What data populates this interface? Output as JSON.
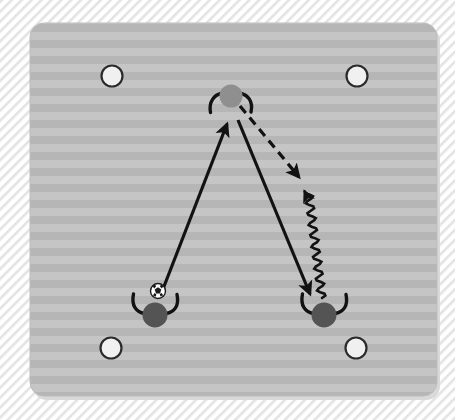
{
  "diagram": {
    "type": "soccer-training-drill",
    "canvas": {
      "width": 455,
      "height": 420
    },
    "background": {
      "name": "hatched-backdrop",
      "hatch_color": "#e2e2e2",
      "base_color": "#ffffff",
      "hatch_spacing": 7,
      "hatch_angle_deg": 45
    },
    "pitch": {
      "name": "training-field",
      "x": 30,
      "y": 23,
      "width": 407,
      "height": 373,
      "corner_radius": 14,
      "stripe_light": "#c3c3c3",
      "stripe_dark": "#b4b4b4",
      "stripe_height": 8,
      "shadow_color": "#d9d9d9"
    },
    "cones": [
      {
        "name": "cone-top-left",
        "label": "Cone",
        "cx": 112,
        "cy": 76,
        "r": 10.5,
        "fill": "#f0f0f0",
        "stroke": "#2b2b2b"
      },
      {
        "name": "cone-top-right",
        "label": "Cone",
        "cx": 357,
        "cy": 76,
        "r": 10.5,
        "fill": "#f0f0f0",
        "stroke": "#2b2b2b"
      },
      {
        "name": "cone-bottom-left",
        "label": "Cone",
        "cx": 111,
        "cy": 348,
        "r": 10.5,
        "fill": "#f0f0f0",
        "stroke": "#2b2b2b"
      },
      {
        "name": "cone-bottom-right",
        "label": "Cone",
        "cx": 356,
        "cy": 348,
        "r": 10.5,
        "fill": "#f0f0f0",
        "stroke": "#2b2b2b"
      }
    ],
    "players": [
      {
        "name": "player-target-top",
        "label": "Target player",
        "role": "target",
        "cx": 231,
        "cy": 96,
        "r": 11.5,
        "fill": "#8f8f8f",
        "arms": "both",
        "has_ball": false
      },
      {
        "name": "player-passer-bottom-left",
        "label": "Passer",
        "role": "passer",
        "cx": 155,
        "cy": 315,
        "r": 12.5,
        "fill": "#545454",
        "arms": "both",
        "has_ball": true
      },
      {
        "name": "player-receiver-bottom-right",
        "label": "Receiver",
        "role": "receiver",
        "cx": 324,
        "cy": 315,
        "r": 12.5,
        "fill": "#545454",
        "arms": "both",
        "has_ball": false
      }
    ],
    "ball": {
      "name": "soccer-ball",
      "label": "Ball",
      "cx": 158,
      "cy": 291,
      "r": 7.5,
      "fill": "#ffffff",
      "patch_color": "#1a1a1a"
    },
    "arrows": [
      {
        "name": "pass-arrow-up",
        "label": "Pass to target player",
        "style": "solid",
        "color": "#121212",
        "width": 3.2,
        "from": {
          "x": 163,
          "y": 289
        },
        "to": {
          "x": 226,
          "y": 122
        }
      },
      {
        "name": "pass-arrow-down-right",
        "label": "Pass to receiver",
        "style": "solid",
        "color": "#121212",
        "width": 3.2,
        "from": {
          "x": 238,
          "y": 120
        },
        "to": {
          "x": 311,
          "y": 296
        }
      },
      {
        "name": "run-arrow-dashed",
        "label": "Player run off the ball",
        "style": "dashed",
        "dash": "9 6",
        "color": "#121212",
        "width": 3.2,
        "from": {
          "x": 240,
          "y": 106
        },
        "to": {
          "x": 301,
          "y": 179
        }
      },
      {
        "name": "dribble-arrow-wavy",
        "label": "Dribble with ball",
        "style": "wavy",
        "color": "#121212",
        "width": 2.6,
        "from": {
          "x": 322,
          "y": 298
        },
        "to": {
          "x": 308,
          "y": 189
        },
        "amplitude": 4,
        "wavelength": 11
      }
    ],
    "legend_semantics": {
      "solid_arrow": "pass",
      "dashed_arrow": "run without ball",
      "wavy_arrow": "dribble",
      "white_circle": "cone / marker",
      "dark_circle": "player",
      "gray_circle": "target player"
    }
  }
}
